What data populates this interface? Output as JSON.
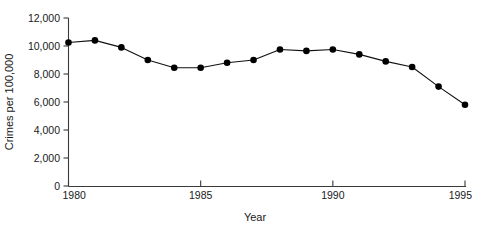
{
  "chart_data": {
    "type": "line",
    "title": "",
    "subtitle": "",
    "xlabel": "Year",
    "ylabel": "Crimes per 100,000",
    "xlim": [
      1980,
      1995
    ],
    "ylim": [
      0,
      12000
    ],
    "grid": false,
    "legend": null,
    "legend_position": "none",
    "x_ticks": [
      1980,
      1985,
      1990,
      1995
    ],
    "x_tick_labels": [
      "1980",
      "1985",
      "1990",
      "1995"
    ],
    "y_ticks": [
      0,
      2000,
      4000,
      6000,
      8000,
      10000,
      12000
    ],
    "y_tick_labels": [
      "0",
      "2,000",
      "4,000",
      "6,000",
      "8,000",
      "10,000",
      "12,000"
    ],
    "x": [
      1980,
      1981,
      1982,
      1983,
      1984,
      1985,
      1986,
      1987,
      1988,
      1989,
      1990,
      1991,
      1992,
      1993,
      1994,
      1995
    ],
    "values": [
      10250,
      10400,
      9900,
      9000,
      8450,
      8450,
      8800,
      9000,
      9750,
      9650,
      9750,
      9400,
      8900,
      8500,
      7100,
      5800
    ],
    "series": [
      {
        "name": "Crimes per 100,000",
        "color": "#000000",
        "marker": "circle",
        "values": [
          10250,
          10400,
          9900,
          9000,
          8450,
          8450,
          8800,
          9000,
          9750,
          9650,
          9750,
          9400,
          8900,
          8500,
          7100,
          5800
        ]
      }
    ]
  },
  "axes": {
    "x_axis_label": "Year",
    "y_axis_label": "Crimes per 100,000"
  },
  "colors": {
    "line": "#111111",
    "marker": "#000000",
    "axis": "#3a3a3a",
    "text": "#1a1a1a",
    "background": "#ffffff"
  }
}
